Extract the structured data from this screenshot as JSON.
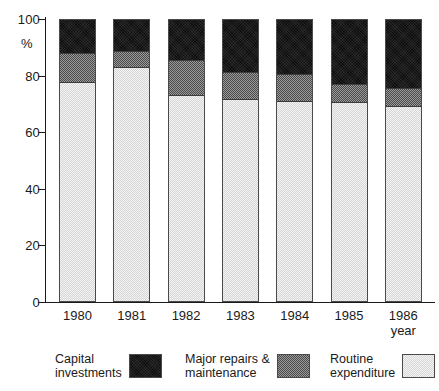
{
  "chart_data": {
    "type": "bar",
    "subtype": "stacked-percentage",
    "title": "",
    "xlabel": "year",
    "ylabel": "%",
    "ylim": [
      0,
      100
    ],
    "yticks": [
      0,
      20,
      40,
      60,
      80,
      100
    ],
    "ytick_labels": [
      "0",
      "20",
      "40",
      "60",
      "80",
      "100"
    ],
    "grid": false,
    "legend_position": "bottom",
    "categories": [
      "1980",
      "1981",
      "1982",
      "1983",
      "1984",
      "1985",
      "1986"
    ],
    "series": [
      {
        "name": "Routine expenditure",
        "key": "routine",
        "color": "#e6e6e6",
        "values": [
          78,
          83.5,
          73.5,
          72,
          71.5,
          71,
          69.5
        ]
      },
      {
        "name": "Major repairs & maintenance",
        "key": "major",
        "color": "#6f6f6f",
        "values": [
          10.5,
          5.5,
          12.5,
          9.5,
          9.5,
          6.5,
          6.5
        ]
      },
      {
        "name": "Capital investments",
        "key": "capital",
        "color": "#0d0d0d",
        "values": [
          11.5,
          11,
          14,
          18.5,
          19,
          22.5,
          24
        ]
      }
    ],
    "cumulative_tops": {
      "routine": [
        78,
        83.5,
        73.5,
        72,
        71.5,
        71,
        69.5
      ],
      "major": [
        88.5,
        89,
        86,
        81.5,
        81,
        77.5,
        76
      ],
      "capital": [
        100,
        100,
        100,
        100,
        100,
        100,
        100
      ]
    }
  },
  "axes": {
    "y_title": "%",
    "x_title": "year",
    "y_ticks": [
      "100",
      "80",
      "60",
      "40",
      "20",
      "0"
    ],
    "x_ticks": [
      "1980",
      "1981",
      "1982",
      "1983",
      "1984",
      "1985",
      "1986"
    ]
  },
  "legend": {
    "items": [
      {
        "label": "Capital\ninvestments",
        "swatch": "capital"
      },
      {
        "label": "Major repairs &\nmaintenance",
        "swatch": "major"
      },
      {
        "label": "Routine\nexpenditure",
        "swatch": "routine"
      }
    ]
  }
}
